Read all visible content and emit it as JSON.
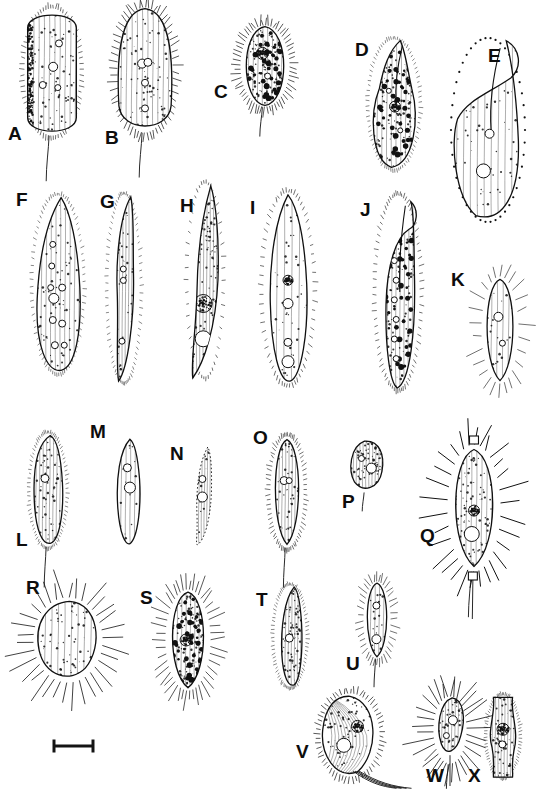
{
  "figure": {
    "kind": "scientific-illustration-plate",
    "background_color": "#ffffff",
    "ink_color": "#111111",
    "panel_count": 24,
    "rows": 4,
    "scale_bar": {
      "name": "scale-bar",
      "label": "",
      "x": 54,
      "y": 746,
      "length_px": 41,
      "cap_height_px": 13
    }
  },
  "panels": [
    {
      "id": "A",
      "label": "A",
      "lx": 8,
      "ly": 124,
      "cx": 52,
      "cy": 72,
      "w": 58,
      "h": 130,
      "shape": "rounded-rect-ciliate",
      "shade": "dark-left",
      "cilia": "dense-short",
      "organelles": [
        [
          0.62,
          0.28,
          7
        ],
        [
          0.52,
          0.46,
          9
        ],
        [
          0.6,
          0.62,
          6
        ],
        [
          0.34,
          0.6,
          7
        ]
      ]
    },
    {
      "id": "B",
      "label": "B",
      "lx": 105,
      "ly": 128,
      "cx": 145,
      "cy": 70,
      "w": 58,
      "h": 128,
      "shape": "oval-ciliate",
      "shade": "light",
      "cilia": "long-radial",
      "organelles": [
        [
          0.45,
          0.45,
          9
        ],
        [
          0.55,
          0.44,
          8
        ],
        [
          0.5,
          0.6,
          7
        ],
        [
          0.5,
          0.8,
          7
        ]
      ]
    },
    {
      "id": "C",
      "label": "C",
      "lx": 214,
      "ly": 82,
      "cx": 265,
      "cy": 66,
      "w": 52,
      "h": 84,
      "shape": "ellipse-ciliate",
      "shade": "mottled",
      "cilia": "long-radial",
      "organelles": [
        [
          0.45,
          0.35,
          12
        ],
        [
          0.55,
          0.62,
          6
        ]
      ]
    },
    {
      "id": "D",
      "label": "D",
      "lx": 355,
      "ly": 40,
      "cx": 394,
      "cy": 104,
      "w": 52,
      "h": 132,
      "shape": "pear-beak",
      "shade": "mottled",
      "cilia": "fine",
      "organelles": [
        [
          0.52,
          0.52,
          11
        ],
        [
          0.4,
          0.4,
          5
        ],
        [
          0.62,
          0.7,
          5
        ]
      ]
    },
    {
      "id": "E",
      "label": "E",
      "lx": 488,
      "ly": 46,
      "cx": 488,
      "cy": 130,
      "w": 76,
      "h": 186,
      "shape": "hook-flask",
      "shade": "light",
      "cilia": "bead-margin",
      "organelles": [
        [
          0.52,
          0.52,
          9
        ],
        [
          0.44,
          0.72,
          14
        ]
      ]
    },
    {
      "id": "F",
      "label": "F",
      "lx": 16,
      "ly": 190,
      "cx": 58,
      "cy": 284,
      "w": 52,
      "h": 180,
      "shape": "teardrop",
      "shade": "light",
      "cilia": "fine",
      "organelles": [
        [
          0.4,
          0.28,
          6
        ],
        [
          0.38,
          0.4,
          6
        ],
        [
          0.36,
          0.52,
          6
        ],
        [
          0.42,
          0.58,
          10
        ],
        [
          0.58,
          0.52,
          7
        ],
        [
          0.4,
          0.7,
          7
        ],
        [
          0.58,
          0.72,
          7
        ],
        [
          0.44,
          0.84,
          7
        ],
        [
          0.62,
          0.84,
          6
        ]
      ]
    },
    {
      "id": "G",
      "label": "G",
      "lx": 100,
      "ly": 192,
      "cx": 124,
      "cy": 288,
      "w": 34,
      "h": 190,
      "shape": "slender-sigmoid",
      "shade": "light",
      "cilia": "fine",
      "organelles": [
        [
          0.48,
          0.4,
          6
        ],
        [
          0.48,
          0.46,
          6
        ],
        [
          0.44,
          0.78,
          6
        ]
      ]
    },
    {
      "id": "H",
      "label": "H",
      "lx": 180,
      "ly": 196,
      "cx": 205,
      "cy": 280,
      "w": 36,
      "h": 196,
      "shape": "curved-spindle",
      "shade": "dark-granular",
      "cilia": "short-rows",
      "organelles": [
        [
          0.45,
          0.62,
          18
        ],
        [
          0.45,
          0.8,
          16
        ]
      ]
    },
    {
      "id": "I",
      "label": "I",
      "lx": 250,
      "ly": 198,
      "cx": 288,
      "cy": 288,
      "w": 52,
      "h": 194,
      "shape": "lanceolate",
      "shade": "pale-stipple",
      "cilia": "short-spiky",
      "organelles": [
        [
          0.5,
          0.46,
          10
        ],
        [
          0.5,
          0.58,
          10
        ],
        [
          0.5,
          0.78,
          8
        ],
        [
          0.5,
          0.88,
          12
        ]
      ]
    },
    {
      "id": "J",
      "label": "J",
      "lx": 360,
      "ly": 200,
      "cx": 398,
      "cy": 292,
      "w": 46,
      "h": 196,
      "shape": "curved-hook-body",
      "shade": "spotted",
      "cilia": "short-dense",
      "organelles": [
        [
          0.44,
          0.22,
          6
        ],
        [
          0.42,
          0.34,
          6
        ],
        [
          0.46,
          0.44,
          6
        ],
        [
          0.42,
          0.54,
          6
        ],
        [
          0.46,
          0.64,
          6
        ],
        [
          0.42,
          0.74,
          6
        ],
        [
          0.46,
          0.84,
          6
        ]
      ]
    },
    {
      "id": "K",
      "label": "K",
      "lx": 451,
      "ly": 270,
      "cx": 500,
      "cy": 330,
      "w": 40,
      "h": 110,
      "shape": "small-oval-tentacles",
      "shade": "faint",
      "cilia": "sparse-long",
      "organelles": [
        [
          0.46,
          0.38,
          9
        ],
        [
          0.56,
          0.62,
          6
        ]
      ]
    },
    {
      "id": "L",
      "label": "L",
      "lx": 16,
      "ly": 530,
      "cx": 48,
      "cy": 490,
      "w": 38,
      "h": 116,
      "shape": "hooded-oval-tail",
      "shade": "light",
      "cilia": "fine",
      "organelles": [
        [
          0.42,
          0.4,
          8
        ]
      ]
    },
    {
      "id": "M",
      "label": "M",
      "lx": 90,
      "ly": 422,
      "cx": 128,
      "cy": 492,
      "w": 32,
      "h": 110,
      "shape": "teardrop-plain",
      "shade": "faint",
      "cilia": "none",
      "organelles": [
        [
          0.48,
          0.28,
          8
        ],
        [
          0.56,
          0.46,
          11
        ]
      ]
    },
    {
      "id": "N",
      "label": "N",
      "lx": 170,
      "ly": 444,
      "cx": 203,
      "cy": 495,
      "w": 30,
      "h": 100,
      "shape": "narrow-pointed-dotted",
      "shade": "dotted-outline",
      "cilia": "none",
      "organelles": [
        [
          0.48,
          0.34,
          7
        ],
        [
          0.48,
          0.52,
          10
        ]
      ]
    },
    {
      "id": "O",
      "label": "O",
      "lx": 253,
      "ly": 428,
      "cx": 287,
      "cy": 492,
      "w": 36,
      "h": 114,
      "shape": "oval-hairy-tail",
      "shade": "light",
      "cilia": "dense-short",
      "organelles": [
        [
          0.42,
          0.4,
          8
        ],
        [
          0.56,
          0.4,
          6
        ]
      ]
    },
    {
      "id": "P",
      "label": "P",
      "lx": 342,
      "ly": 492,
      "cx": 366,
      "cy": 466,
      "w": 38,
      "h": 54,
      "shape": "bean-striated-tail",
      "shade": "striated",
      "cilia": "none",
      "organelles": [
        [
          0.38,
          0.36,
          6
        ],
        [
          0.64,
          0.54,
          10
        ]
      ]
    },
    {
      "id": "Q",
      "label": "Q",
      "lx": 420,
      "ly": 526,
      "cx": 474,
      "cy": 508,
      "w": 56,
      "h": 130,
      "shape": "ellipse-spines-collars",
      "shade": "stipple-dark-left",
      "cilia": "long-spines",
      "organelles": [
        [
          0.5,
          0.52,
          11
        ],
        [
          0.46,
          0.7,
          15
        ]
      ]
    },
    {
      "id": "R",
      "label": "R",
      "lx": 26,
      "ly": 578,
      "cx": 68,
      "cy": 640,
      "w": 72,
      "h": 88,
      "shape": "lobed-suctorian-rays",
      "shade": "light",
      "cilia": "long-rays",
      "organelles": []
    },
    {
      "id": "S",
      "label": "S",
      "lx": 140,
      "ly": 588,
      "cx": 188,
      "cy": 640,
      "w": 48,
      "h": 104,
      "shape": "oval-bristles-macronucleus",
      "shade": "granular",
      "cilia": "long-bristles",
      "organelles": [
        [
          0.46,
          0.5,
          12
        ]
      ]
    },
    {
      "id": "T",
      "label": "T",
      "lx": 256,
      "ly": 590,
      "cx": 290,
      "cy": 636,
      "w": 34,
      "h": 104,
      "shape": "slender-hooked-tail",
      "shade": "stipple",
      "cilia": "fine",
      "organelles": [
        [
          0.48,
          0.52,
          8
        ]
      ]
    },
    {
      "id": "U",
      "label": "U",
      "lx": 346,
      "ly": 654,
      "cx": 377,
      "cy": 620,
      "w": 30,
      "h": 80,
      "shape": "small-oval-cilia-tail",
      "shade": "faint",
      "cilia": "medium-radial",
      "organelles": [
        [
          0.48,
          0.32,
          7
        ],
        [
          0.48,
          0.74,
          9
        ]
      ]
    },
    {
      "id": "V",
      "label": "V",
      "lx": 296,
      "ly": 742,
      "cx": 350,
      "cy": 735,
      "w": 62,
      "h": 86,
      "shape": "spiral-banded-cilia",
      "shade": "banded",
      "cilia": "dense-bands",
      "organelles": [
        [
          0.62,
          0.4,
          12
        ],
        [
          0.4,
          0.62,
          14
        ]
      ]
    },
    {
      "id": "W",
      "label": "W",
      "lx": 426,
      "ly": 766,
      "cx": 450,
      "cy": 730,
      "w": 36,
      "h": 70,
      "shape": "angular-flagellate-rays",
      "shade": "light",
      "cilia": "long-rays",
      "organelles": [
        [
          0.58,
          0.36,
          9
        ],
        [
          0.4,
          0.58,
          6
        ]
      ]
    },
    {
      "id": "X",
      "label": "X",
      "lx": 468,
      "ly": 766,
      "cx": 503,
      "cy": 736,
      "w": 34,
      "h": 84,
      "shape": "tube-lorica-cell",
      "shade": "light",
      "cilia": "fine",
      "organelles": [
        [
          0.5,
          0.42,
          12
        ],
        [
          0.48,
          0.6,
          7
        ]
      ]
    }
  ]
}
